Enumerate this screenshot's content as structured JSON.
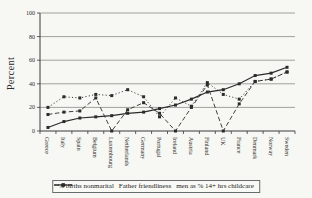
{
  "figure": {
    "background": "#f7f7f3",
    "ink": "#2b2b2b",
    "grid_color": "#8a8a86",
    "axis_color": "#3a3a3a"
  },
  "chart_data": {
    "type": "line",
    "title": "",
    "xlabel": "",
    "ylabel": "Percent",
    "ylim": [
      0,
      100
    ],
    "yticks": [
      0,
      20,
      40,
      60,
      80,
      100
    ],
    "grid": true,
    "legend_position": "bottom",
    "categories": [
      "Greece",
      "Italy",
      "Spain",
      "Belgium",
      "Luxembourg",
      "Netherlands",
      "Germany",
      "Portugal",
      "Ireland",
      "Austria",
      "Finland",
      "UK",
      "France",
      "Denmark",
      "Norway",
      "Sweden"
    ],
    "series": [
      {
        "name": "% births nonmarital",
        "style": "solid",
        "marker": "square",
        "values": [
          3,
          8,
          11,
          12,
          13,
          15,
          16,
          19,
          22,
          27,
          33,
          35,
          40,
          47,
          49,
          54
        ]
      },
      {
        "name": "Father friendliness",
        "style": "dashed",
        "marker": "square",
        "values": [
          14,
          16,
          17,
          28,
          0,
          18,
          24,
          15,
          0,
          20,
          39,
          0,
          23,
          42,
          44,
          50
        ]
      },
      {
        "name": "men as % 14+ hrs childcare",
        "style": "dotted",
        "marker": "square",
        "values": [
          20,
          29,
          28,
          31,
          30,
          35,
          29,
          12,
          28,
          21,
          41,
          31,
          27,
          42,
          44,
          50
        ]
      }
    ]
  }
}
